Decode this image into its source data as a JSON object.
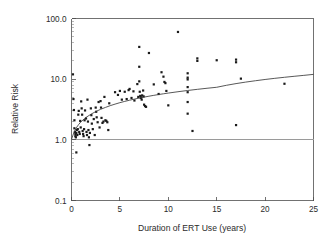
{
  "chart_data": {
    "type": "scatter",
    "title": "",
    "xlabel": "Duration of ERT Use (years)",
    "ylabel": "Relative Risk",
    "xlim": [
      0,
      25
    ],
    "ylim": [
      0.1,
      100.0
    ],
    "yscale": "log",
    "xscale": "linear",
    "grid": false,
    "legend": "none",
    "xticks": [
      0,
      5,
      10,
      15,
      20,
      25
    ],
    "xtick_labels": [
      "0",
      "5",
      "10",
      "15",
      "20",
      "25"
    ],
    "yticks": [
      0.1,
      1.0,
      10.0,
      100.0
    ],
    "ytick_labels": [
      "0.1",
      "1.0",
      "10.0",
      "100.0"
    ],
    "annotations": [
      {
        "name": "null-effect-reference-line",
        "type": "hline",
        "y": 1.0,
        "label": "",
        "color": "#9a9a9a"
      }
    ],
    "series": [
      {
        "name": "Study estimates",
        "marker": "square",
        "color": "#1a1a1a",
        "points": [
          [
            0.15,
            12.0
          ],
          [
            0.2,
            4.7
          ],
          [
            0.25,
            3.1
          ],
          [
            0.3,
            2.1
          ],
          [
            0.3,
            1.55
          ],
          [
            0.35,
            1.35
          ],
          [
            0.4,
            1.25
          ],
          [
            0.4,
            1.15
          ],
          [
            0.45,
            1.1
          ],
          [
            0.5,
            1.3
          ],
          [
            0.5,
            0.62
          ],
          [
            0.55,
            1.45
          ],
          [
            0.6,
            1.2
          ],
          [
            0.65,
            1.5
          ],
          [
            0.7,
            2.6
          ],
          [
            0.75,
            3.0
          ],
          [
            0.8,
            1.35
          ],
          [
            0.85,
            1.25
          ],
          [
            0.9,
            2.05
          ],
          [
            0.95,
            1.6
          ],
          [
            1.0,
            4.3
          ],
          [
            1.05,
            3.3
          ],
          [
            1.1,
            2.6
          ],
          [
            1.15,
            1.4
          ],
          [
            1.2,
            1.25
          ],
          [
            1.25,
            1.15
          ],
          [
            1.3,
            1.5
          ],
          [
            1.35,
            2.1
          ],
          [
            1.4,
            3.05
          ],
          [
            1.5,
            2.25
          ],
          [
            1.55,
            1.35
          ],
          [
            1.6,
            1.2
          ],
          [
            1.65,
            4.6
          ],
          [
            1.7,
            2.0
          ],
          [
            1.75,
            1.45
          ],
          [
            1.8,
            1.1
          ],
          [
            1.85,
            0.82
          ],
          [
            1.9,
            1.3
          ],
          [
            2.0,
            3.3
          ],
          [
            2.05,
            2.55
          ],
          [
            2.1,
            1.85
          ],
          [
            2.2,
            1.5
          ],
          [
            2.3,
            2.2
          ],
          [
            2.4,
            1.2
          ],
          [
            2.5,
            3.4
          ],
          [
            2.55,
            2.9
          ],
          [
            2.6,
            2.35
          ],
          [
            2.7,
            1.95
          ],
          [
            2.8,
            4.2
          ],
          [
            2.9,
            1.6
          ],
          [
            3.0,
            4.35
          ],
          [
            3.05,
            3.4
          ],
          [
            3.1,
            2.3
          ],
          [
            3.2,
            1.9
          ],
          [
            3.3,
            2.0
          ],
          [
            3.4,
            5.1
          ],
          [
            3.5,
            2.1
          ],
          [
            3.6,
            2.05
          ],
          [
            3.7,
            1.95
          ],
          [
            3.8,
            1.45
          ],
          [
            3.9,
            4.0
          ],
          [
            4.5,
            6.1
          ],
          [
            4.8,
            5.5
          ],
          [
            5.0,
            6.4
          ],
          [
            5.2,
            4.6
          ],
          [
            5.5,
            6.2
          ],
          [
            5.7,
            4.7
          ],
          [
            5.9,
            6.6
          ],
          [
            6.0,
            6.9
          ],
          [
            6.2,
            4.9
          ],
          [
            6.4,
            6.3
          ],
          [
            6.5,
            4.45
          ],
          [
            6.8,
            8.3
          ],
          [
            6.9,
            5.1
          ],
          [
            7.0,
            34.0
          ],
          [
            7.0,
            16.0
          ],
          [
            7.0,
            9.2
          ],
          [
            7.05,
            6.2
          ],
          [
            7.1,
            5.3
          ],
          [
            7.15,
            4.9
          ],
          [
            7.2,
            5.0
          ],
          [
            7.25,
            4.6
          ],
          [
            7.3,
            5.4
          ],
          [
            7.4,
            6.5
          ],
          [
            7.45,
            5.2
          ],
          [
            7.5,
            3.8
          ],
          [
            7.6,
            3.6
          ],
          [
            7.7,
            3.5
          ],
          [
            8.0,
            27.0
          ],
          [
            8.5,
            8.2
          ],
          [
            9.0,
            5.7
          ],
          [
            9.3,
            13.0
          ],
          [
            9.5,
            11.0
          ],
          [
            9.6,
            9.0
          ],
          [
            9.7,
            8.6
          ],
          [
            9.8,
            6.4
          ],
          [
            10.0,
            3.7
          ],
          [
            11.0,
            60.0
          ],
          [
            12.0,
            12.5
          ],
          [
            12.0,
            10.6
          ],
          [
            12.0,
            9.9
          ],
          [
            12.0,
            7.4
          ],
          [
            12.0,
            6.1
          ],
          [
            12.0,
            4.2
          ],
          [
            12.0,
            2.7
          ],
          [
            12.5,
            1.4
          ],
          [
            13.0,
            22.0
          ],
          [
            13.0,
            20.0
          ],
          [
            15.0,
            20.5
          ],
          [
            17.0,
            21.0
          ],
          [
            17.0,
            19.0
          ],
          [
            17.0,
            1.75
          ],
          [
            17.5,
            10.2
          ],
          [
            22.0,
            8.4
          ]
        ]
      }
    ],
    "fit": {
      "name": "fitted logarithmic trend",
      "type": "curve",
      "color": "#3a3a3a",
      "description": "Relative Risk rises from about 1.0 at 0 years to about 12 at 25 years",
      "points": [
        [
          0.0,
          1.02
        ],
        [
          0.25,
          1.32
        ],
        [
          0.5,
          1.58
        ],
        [
          0.75,
          1.8
        ],
        [
          1.0,
          2.0
        ],
        [
          1.5,
          2.34
        ],
        [
          2.0,
          2.64
        ],
        [
          2.5,
          2.92
        ],
        [
          3.0,
          3.18
        ],
        [
          3.5,
          3.42
        ],
        [
          4.0,
          3.66
        ],
        [
          4.5,
          3.88
        ],
        [
          5.0,
          4.1
        ],
        [
          5.5,
          4.3
        ],
        [
          6.0,
          4.5
        ],
        [
          6.5,
          4.69
        ],
        [
          7.0,
          4.88
        ],
        [
          7.5,
          5.06
        ],
        [
          8.0,
          5.24
        ],
        [
          8.5,
          5.41
        ],
        [
          9.0,
          5.58
        ],
        [
          9.5,
          5.74
        ],
        [
          10.0,
          5.9
        ],
        [
          11.0,
          6.21
        ],
        [
          12.0,
          6.51
        ],
        [
          13.0,
          6.8
        ],
        [
          14.0,
          7.08
        ],
        [
          15.0,
          7.35
        ],
        [
          16.0,
          7.92
        ],
        [
          17.0,
          8.45
        ],
        [
          18.0,
          8.95
        ],
        [
          19.0,
          9.42
        ],
        [
          20.0,
          9.88
        ],
        [
          21.0,
          10.32
        ],
        [
          22.0,
          10.74
        ],
        [
          23.0,
          11.15
        ],
        [
          24.0,
          11.55
        ],
        [
          25.0,
          12.0
        ]
      ]
    }
  },
  "axes": {
    "x_title": "Duration of ERT Use (years)",
    "y_title": "Relative Risk",
    "x_tick_labels": [
      "0",
      "5",
      "10",
      "15",
      "20",
      "25"
    ],
    "y_tick_labels": [
      "100.0",
      "10.0",
      "1.0",
      "0.1"
    ]
  },
  "colors": {
    "marker": "#1a1a1a",
    "curve": "#3a3a3a",
    "reference": "#9a9a9a",
    "axis": "#4d4d4d",
    "background": "#ffffff"
  }
}
